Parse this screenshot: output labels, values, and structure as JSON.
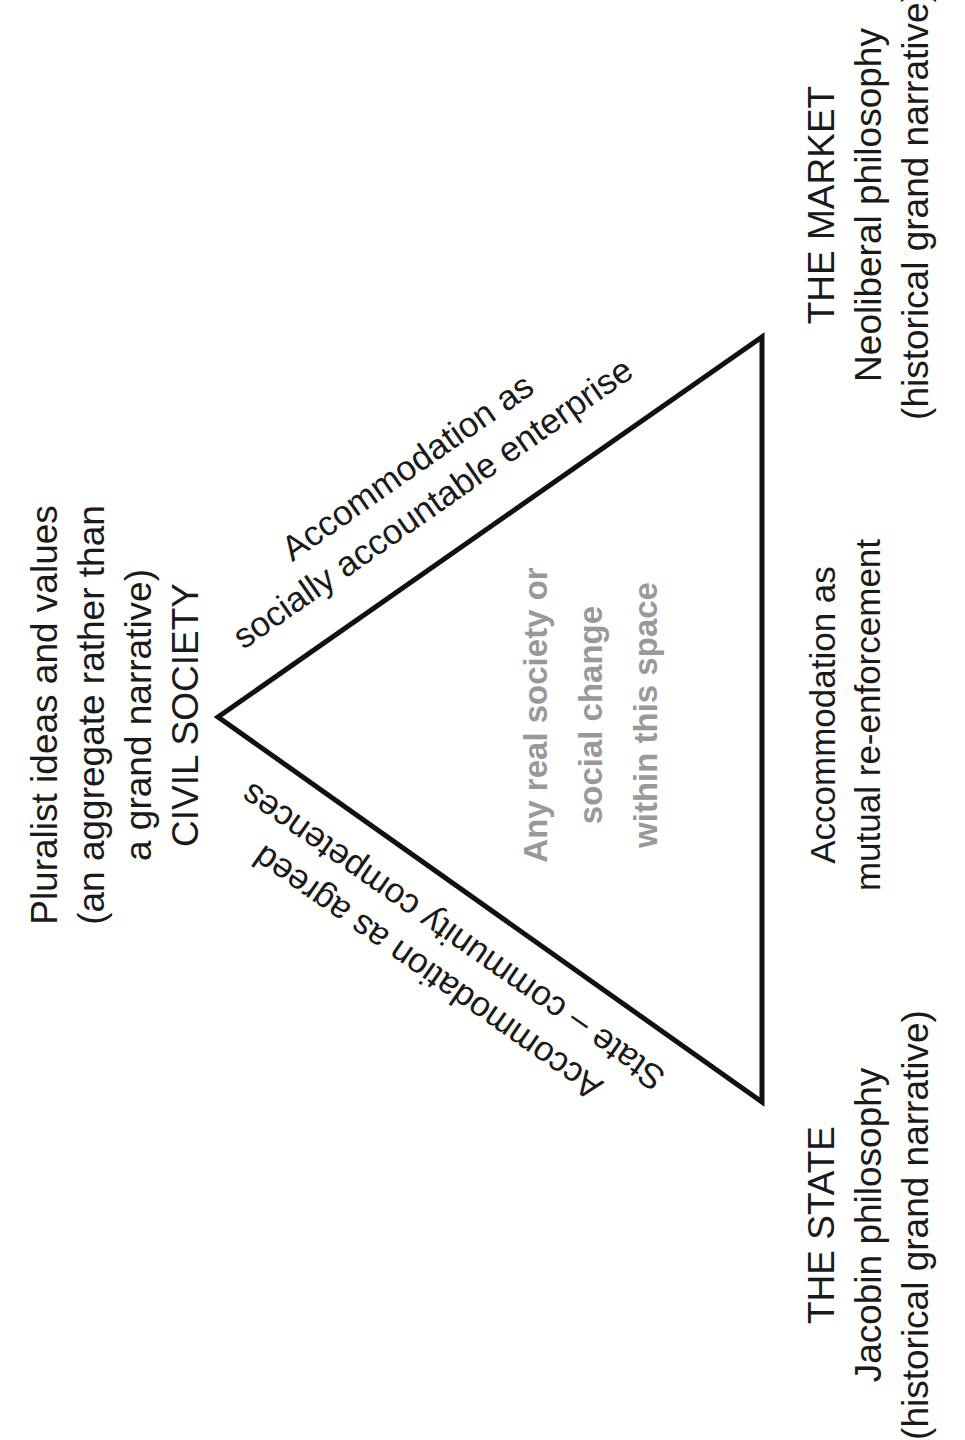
{
  "diagram": {
    "orientation": "rotated 90° counter-clockwise",
    "shape": "triangle",
    "colors": {
      "stroke": "#111111",
      "text": "#1a1a1a",
      "inner_text": "#999999",
      "background": "#ffffff"
    },
    "vertices": {
      "civil_society": {
        "lines": [
          "Pluralist ideas and values",
          "(an aggregate rather than",
          "a grand narrative)",
          "CIVIL SOCIETY"
        ]
      },
      "market": {
        "lines": [
          "THE MARKET",
          "Neoliberal philosophy",
          "(historical grand narrative)"
        ]
      },
      "state": {
        "lines": [
          "THE STATE",
          "Jacobin philosophy",
          "(historical grand narrative)"
        ]
      }
    },
    "edges": {
      "civil_society_market": {
        "lines": [
          "Accommodation as",
          "socially accountable enterprise"
        ]
      },
      "civil_society_state": {
        "lines": [
          "State – community",
          "Accommodation as agreed",
          "competences"
        ],
        "lines_rendered": [
          "Accommodation as agreed",
          "State – community competences"
        ]
      },
      "state_market": {
        "lines": [
          "Accommodation as",
          "mutual re-enforcement"
        ]
      }
    },
    "center": {
      "lines": [
        "Any real society or",
        "social change",
        "within this space"
      ]
    }
  }
}
